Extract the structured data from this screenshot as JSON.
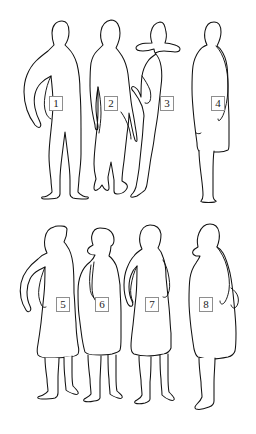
{
  "canvas": {
    "width": 256,
    "height": 434,
    "background_color": "#ffffff",
    "stroke_color": "#111111",
    "label_border_color": "#8e8e8e"
  },
  "figures": [
    {
      "id": 1,
      "label": "1",
      "label_x": 49,
      "label_y": 96,
      "row": 1,
      "pose": "standing-hand-on-hip-facing-left"
    },
    {
      "id": 2,
      "label": "2",
      "label_x": 104,
      "label_y": 96,
      "row": 1,
      "pose": "standing-arms-down-long-coat"
    },
    {
      "id": 3,
      "label": "3",
      "label_x": 160,
      "label_y": 96,
      "row": 1,
      "pose": "standing-wide-brim-hat-hand-on-hip"
    },
    {
      "id": 4,
      "label": "4",
      "label_x": 211,
      "label_y": 96,
      "row": 1,
      "pose": "standing-coat-arms-down"
    },
    {
      "id": 5,
      "label": "5",
      "label_x": 56,
      "label_y": 297,
      "row": 2,
      "pose": "standing-hand-on-hip-dress-boots"
    },
    {
      "id": 6,
      "label": "6",
      "label_x": 95,
      "label_y": 297,
      "row": 2,
      "pose": "standing-hat-arms-down-short-dress"
    },
    {
      "id": 7,
      "label": "7",
      "label_x": 145,
      "label_y": 297,
      "row": 2,
      "pose": "standing-hands-on-hips-skirt"
    },
    {
      "id": 8,
      "label": "8",
      "label_x": 199,
      "label_y": 297,
      "row": 2,
      "pose": "profile-facing-left-hand-on-hip"
    }
  ]
}
